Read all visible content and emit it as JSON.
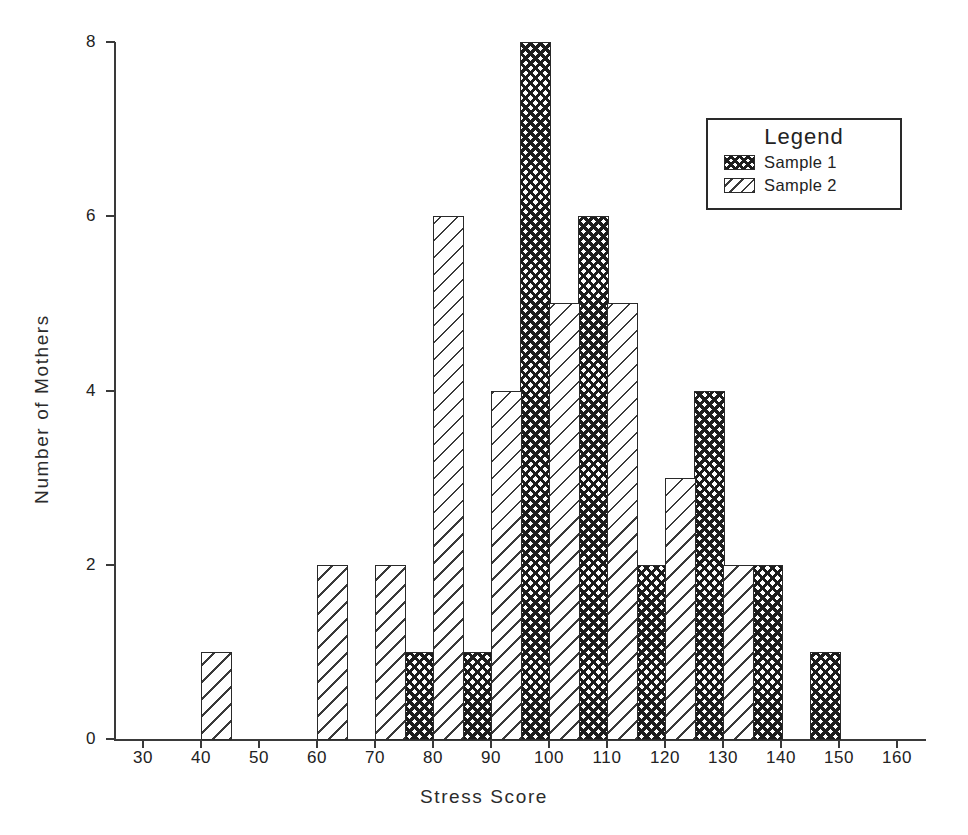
{
  "chart_data": {
    "type": "bar",
    "title": "",
    "xlabel": "Stress Score",
    "ylabel": "Number of Mothers",
    "xlim": [
      25,
      165
    ],
    "ylim": [
      0,
      8
    ],
    "xticks": [
      30,
      40,
      50,
      60,
      70,
      80,
      90,
      100,
      110,
      120,
      130,
      140,
      150,
      160
    ],
    "yticks": [
      0,
      2,
      4,
      6,
      8
    ],
    "grid": false,
    "bin_width": 5,
    "legend": {
      "title": "Legend",
      "position": "upper-right",
      "entries": [
        {
          "name": "Sample 1",
          "pattern": "cross-hatch"
        },
        {
          "name": "Sample 2",
          "pattern": "diagonal-hatch"
        }
      ]
    },
    "series": [
      {
        "name": "Sample 1",
        "pattern": "cross-hatch",
        "bins": [
          {
            "x0": 75,
            "x1": 80,
            "value": 1
          },
          {
            "x0": 85,
            "x1": 90,
            "value": 1
          },
          {
            "x0": 95,
            "x1": 100,
            "value": 8
          },
          {
            "x0": 105,
            "x1": 110,
            "value": 6
          },
          {
            "x0": 115,
            "x1": 120,
            "value": 2
          },
          {
            "x0": 125,
            "x1": 130,
            "value": 4
          },
          {
            "x0": 135,
            "x1": 140,
            "value": 2
          },
          {
            "x0": 145,
            "x1": 150,
            "value": 1
          }
        ]
      },
      {
        "name": "Sample 2",
        "pattern": "diagonal-hatch",
        "bins": [
          {
            "x0": 40,
            "x1": 45,
            "value": 1
          },
          {
            "x0": 60,
            "x1": 65,
            "value": 2
          },
          {
            "x0": 70,
            "x1": 75,
            "value": 2
          },
          {
            "x0": 80,
            "x1": 85,
            "value": 6
          },
          {
            "x0": 90,
            "x1": 95,
            "value": 4
          },
          {
            "x0": 100,
            "x1": 105,
            "value": 5
          },
          {
            "x0": 110,
            "x1": 115,
            "value": 5
          },
          {
            "x0": 120,
            "x1": 125,
            "value": 3
          },
          {
            "x0": 130,
            "x1": 135,
            "value": 2
          }
        ]
      }
    ]
  },
  "colors": {
    "ink": "#2a2a2a",
    "background": "#ffffff"
  }
}
